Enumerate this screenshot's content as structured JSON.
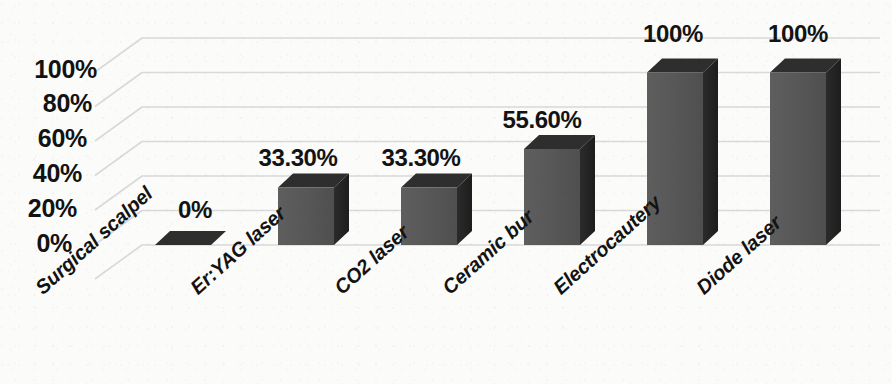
{
  "chart_data": {
    "type": "bar",
    "title": "",
    "subtitle": "",
    "xlabel": "",
    "ylabel": "",
    "categories": [
      "Surgical scalpel",
      "Er:YAG laser",
      "CO2 laser",
      "Ceramic bur",
      "Electrocautery",
      "Diode laser"
    ],
    "values": [
      0,
      33.3,
      33.3,
      55.6,
      100,
      100
    ],
    "data_labels": [
      "0%",
      "33.30%",
      "33.30%",
      "55.60%",
      "100%",
      "100%"
    ],
    "ytick_labels": [
      "100%",
      "80%",
      "60%",
      "40%",
      "20%",
      "0%"
    ],
    "ytick_values": [
      100,
      80,
      60,
      40,
      20,
      0
    ],
    "ylim": [
      0,
      120
    ],
    "gridline_values": [
      120,
      100,
      80,
      60,
      40,
      20,
      0
    ],
    "grid": true,
    "legend": "none",
    "three_d": true,
    "colors": {
      "bar_front": "#575757",
      "bar_side": "#232323",
      "bar_top": "#2e2e2e",
      "gridline": "#d9d9d9",
      "text": "#121212",
      "background": "#fbfbfa"
    }
  },
  "axis": {
    "ytick_0": "100%",
    "ytick_1": "80%",
    "ytick_2": "60%",
    "ytick_3": "40%",
    "ytick_4": "20%",
    "ytick_5": "0%"
  },
  "bars": {
    "label_0": "0%",
    "label_1": "33.30%",
    "label_2": "33.30%",
    "label_3": "55.60%",
    "label_4": "100%",
    "label_5": "100%",
    "cat_0": "Surgical scalpel",
    "cat_1": "Er:YAG laser",
    "cat_2": "CO2 laser",
    "cat_3": "Ceramic bur",
    "cat_4": "Electrocautery",
    "cat_5": "Diode laser"
  }
}
